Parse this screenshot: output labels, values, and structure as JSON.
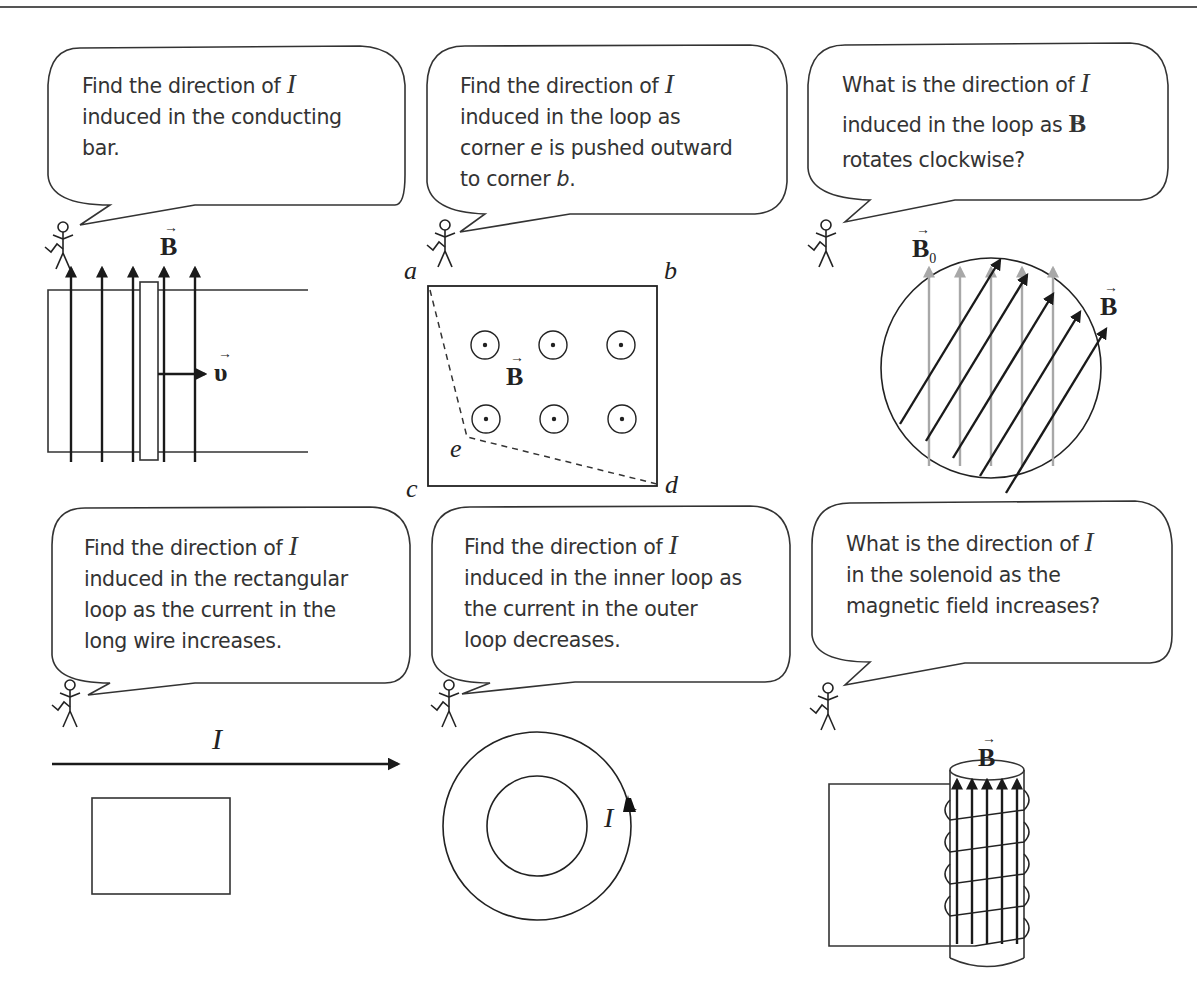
{
  "panels": [
    {
      "id": "conducting-bar",
      "question": {
        "lines": [
          "Find the direction of ",
          "induced in the conducting",
          "bar."
        ],
        "symbol": "I"
      },
      "labels": {
        "field": "B",
        "velocity": "υ"
      }
    },
    {
      "id": "deforming-loop",
      "question": {
        "lines": [
          "Find the direction of ",
          "induced in the loop as",
          "corner ",
          "e",
          " is pushed outward",
          "to corner ",
          "b",
          "."
        ],
        "symbol": "I"
      },
      "labels": {
        "a": "a",
        "b": "b",
        "c": "c",
        "d": "d",
        "e": "e",
        "field": "B"
      }
    },
    {
      "id": "rotating-field",
      "question": {
        "lines": [
          "What is the direction of ",
          "induced in the loop as ",
          "rotates clockwise?"
        ],
        "symbol": "I",
        "field_symbol": "B"
      },
      "labels": {
        "initial_field": "B",
        "initial_sub": "0",
        "field": "B"
      },
      "colors": {
        "initial_field": "#a8a8a8",
        "rotated_field": "#1a1a1a"
      }
    },
    {
      "id": "long-wire",
      "question": {
        "lines": [
          "Find the direction of ",
          "induced in the rectangular",
          "loop as the current in the",
          "long wire increases."
        ],
        "symbol": "I"
      },
      "labels": {
        "current": "I"
      }
    },
    {
      "id": "concentric-loops",
      "question": {
        "lines": [
          "Find the direction of ",
          "induced in the inner loop as",
          "the current in the outer",
          "loop decreases."
        ],
        "symbol": "I"
      },
      "labels": {
        "current": "I"
      }
    },
    {
      "id": "solenoid",
      "question": {
        "lines": [
          "What is the direction of ",
          "in the solenoid as the",
          "magnetic field increases?"
        ],
        "symbol": "I"
      },
      "labels": {
        "field": "B"
      }
    }
  ],
  "icons": {
    "stick_figure": "stick-figure-icon",
    "speech_bubble": "speech-bubble-icon",
    "out_of_page": "dot-in-circle-icon",
    "vector_arrow": "→"
  }
}
